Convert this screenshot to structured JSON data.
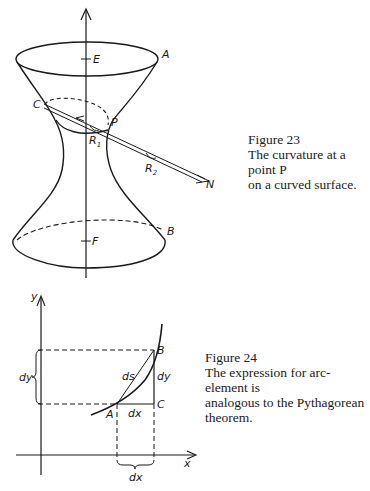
{
  "figure23": {
    "caption_title": "Figure 23",
    "caption_line1": "The curvature at a point P",
    "caption_line2": "on a curved surface.",
    "labels": {
      "E": "E",
      "A": "A",
      "C": "C",
      "P": "P",
      "R1": "R",
      "R1_sub": "1",
      "R2": "R",
      "R2_sub": "2",
      "N": "N",
      "B": "B",
      "F": "F"
    }
  },
  "figure24": {
    "caption_title": "Figure 24",
    "caption_line1": "The expression for arc-element is",
    "caption_line2": "analogous to the Pythagorean",
    "caption_line3": "theorem.",
    "labels": {
      "y_axis": "y",
      "x_axis": "x",
      "A": "A",
      "B": "B",
      "C": "C",
      "ds": "ds",
      "dy_right": "dy",
      "dy_left": "dy",
      "dx_inner": "dx",
      "dx_bottom": "dx"
    }
  },
  "colors": {
    "ink": "#1a1a1a",
    "background": "#ffffff"
  }
}
